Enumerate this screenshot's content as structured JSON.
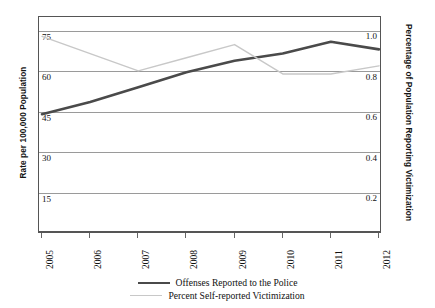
{
  "chart_data": {
    "type": "line",
    "title": "",
    "subtitle": "",
    "xlabel": "",
    "ylabel": "Rate per 100,000 Population",
    "y2label": "Percentage of Population Reporting Victimization",
    "categories": [
      "2005",
      "2006",
      "2007",
      "2008",
      "2009",
      "2010",
      "2011",
      "2012"
    ],
    "ylim": [
      0,
      80
    ],
    "y_ticks": [
      15,
      30,
      45,
      60,
      75
    ],
    "y_tick_labels": [
      "15",
      "30",
      "45",
      "60",
      "75"
    ],
    "y2lim": [
      0,
      1.066
    ],
    "y2_ticks": [
      0.2,
      0.4,
      0.6,
      0.8,
      1.0
    ],
    "y2_tick_labels": [
      "0.2",
      "0.4",
      "0.6",
      "0.8",
      "1.0"
    ],
    "grid": true,
    "grid_axis": "y",
    "legend_position": "bottom",
    "series": [
      {
        "name": "Offenses Reported to the Police",
        "axis": "left",
        "color": "#4a4a4a",
        "line_width": 2.6,
        "values": [
          44.0,
          48.5,
          54.0,
          59.5,
          63.8,
          66.5,
          70.8,
          68.0
        ]
      },
      {
        "name": "Percent Self-reported Victimization",
        "axis": "right",
        "color": "#c8c8c8",
        "line_width": 1.4,
        "values": [
          0.97,
          0.885,
          0.8,
          0.865,
          0.93,
          0.785,
          0.785,
          0.825
        ]
      }
    ]
  },
  "axes": {
    "left_title": "Rate per 100,000 Population",
    "right_title": "Percentage of Population Reporting Victimization"
  },
  "legend": {
    "items": [
      {
        "label": "Offenses Reported to the Police",
        "style": "thick"
      },
      {
        "label": "Percent Self-reported Victimization",
        "style": "thin"
      }
    ]
  },
  "colors": {
    "series_dark": "#4a4a4a",
    "series_light": "#c8c8c8",
    "gridline": "#9a9a9a",
    "frame": "#555555",
    "background": "#ffffff"
  }
}
